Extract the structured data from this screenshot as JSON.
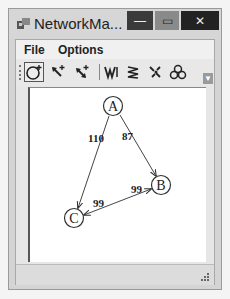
{
  "window": {
    "title": "NetworkMa...",
    "controls": {
      "minimize": "—",
      "maximize": "▭",
      "close": "✕"
    }
  },
  "menu": {
    "items": [
      {
        "label": "File"
      },
      {
        "label": "Options"
      }
    ]
  },
  "toolbar": {
    "buttons": [
      {
        "name": "add-node",
        "icon": "circle-plus-icon",
        "active": true
      },
      {
        "name": "add-edge",
        "icon": "arrow-plus-icon"
      },
      {
        "name": "add-bidirectional-edge",
        "icon": "double-arrow-plus-icon"
      },
      {
        "name": "layout-w",
        "icon": "zigzag-w-icon"
      },
      {
        "name": "layout-m",
        "icon": "zigzag-m-icon"
      },
      {
        "name": "scatter",
        "icon": "scatter-icon"
      },
      {
        "name": "cluster",
        "icon": "cluster-icon"
      }
    ],
    "overflow_label": "▼"
  },
  "graph": {
    "nodes": [
      {
        "id": "A",
        "label": "A",
        "x": 83,
        "y": 18
      },
      {
        "id": "B",
        "label": "B",
        "x": 131,
        "y": 97
      },
      {
        "id": "C",
        "label": "C",
        "x": 44,
        "y": 130
      }
    ],
    "edges": [
      {
        "from": "A",
        "to": "C",
        "weight": "110",
        "label_x": 58,
        "label_y": 54
      },
      {
        "from": "A",
        "to": "B",
        "weight": "87",
        "label_x": 92,
        "label_y": 52
      },
      {
        "from": "C",
        "to": "B",
        "weight": "99",
        "label_x": 103,
        "label_y": 104
      },
      {
        "from": "B",
        "to": "C",
        "weight": "99",
        "label_x": 64,
        "label_y": 118
      }
    ]
  }
}
